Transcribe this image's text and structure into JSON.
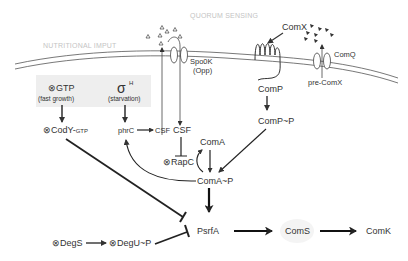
{
  "diagram": {
    "zones": {
      "nutritional": "NUTRITIONAL IMPUT",
      "quorum": "QUORUM SENSING"
    },
    "colors": {
      "line": "#333333",
      "zone_text": "#c4c4c4",
      "box_fill": "#eeeeee",
      "coms_fill": "#f4f4f4"
    },
    "nodes": {
      "gtp": "GTP",
      "gtp_sub": "(fast growth)",
      "sigma": "σ",
      "sigma_sup": "H",
      "sigma_sub": "(starvation)",
      "cody": "CodY-",
      "cody_sub": "GTP",
      "phrc": "phrC",
      "csf_small": "CSF",
      "csf": "CSF",
      "rapc": "RapC",
      "spo0k": "Spo0K",
      "opp": "(Opp)",
      "comx": "ComX",
      "comq": "ComQ",
      "precomx": "pre-ComX",
      "comp": "ComP",
      "compp": "ComP~P",
      "coma": "ComA",
      "comap": "ComA~P",
      "psrfa": "PsrfA",
      "coms": "ComS",
      "comk": "ComK",
      "degs": "DegS",
      "degup": "DegU~P",
      "otimes": "⊗"
    }
  }
}
